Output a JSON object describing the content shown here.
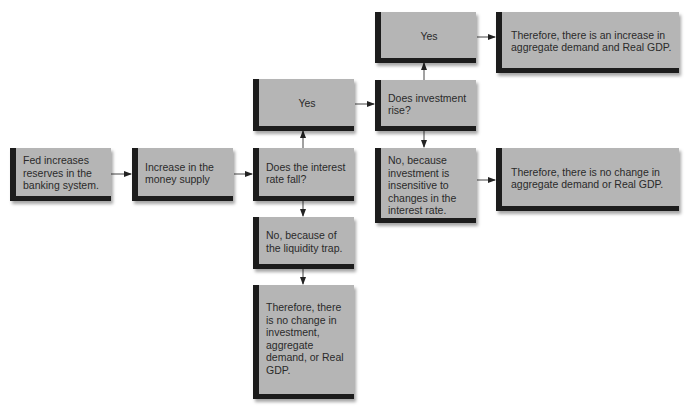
{
  "diagram": {
    "type": "flowchart",
    "nodes": [
      {
        "id": "fed",
        "label": "Fed increases reserves in the banking system."
      },
      {
        "id": "money",
        "label": "Increase in the money supply"
      },
      {
        "id": "rate_q",
        "label": "Does the interest rate fall?"
      },
      {
        "id": "rate_yes",
        "label": "Yes"
      },
      {
        "id": "liquidity",
        "label": "No, because of the liquidity trap."
      },
      {
        "id": "no_change_inv",
        "label": "Therefore, there is no change in investment, aggregate demand, or Real GDP."
      },
      {
        "id": "inv_q",
        "label": "Does investment rise?"
      },
      {
        "id": "inv_yes",
        "label": "Yes"
      },
      {
        "id": "inv_no",
        "label": "No, because investment is insensitive to changes in the interest rate."
      },
      {
        "id": "increase",
        "label": "Therefore, there is an increase in aggregate demand and Real GDP."
      },
      {
        "id": "no_change",
        "label": "Therefore, there is no change in aggregate demand or Real GDP."
      }
    ],
    "edges": [
      {
        "from": "fed",
        "to": "money"
      },
      {
        "from": "money",
        "to": "rate_q"
      },
      {
        "from": "rate_q",
        "to": "rate_yes"
      },
      {
        "from": "rate_q",
        "to": "liquidity"
      },
      {
        "from": "liquidity",
        "to": "no_change_inv"
      },
      {
        "from": "rate_yes",
        "to": "inv_q"
      },
      {
        "from": "inv_q",
        "to": "inv_yes"
      },
      {
        "from": "inv_q",
        "to": "inv_no"
      },
      {
        "from": "inv_yes",
        "to": "increase"
      },
      {
        "from": "inv_no",
        "to": "no_change"
      }
    ],
    "colors": {
      "box_fill": "#b5b5b5",
      "box_accent": "#1c1c1c",
      "arrow": "#222222",
      "text": "#2a2a2a"
    }
  }
}
